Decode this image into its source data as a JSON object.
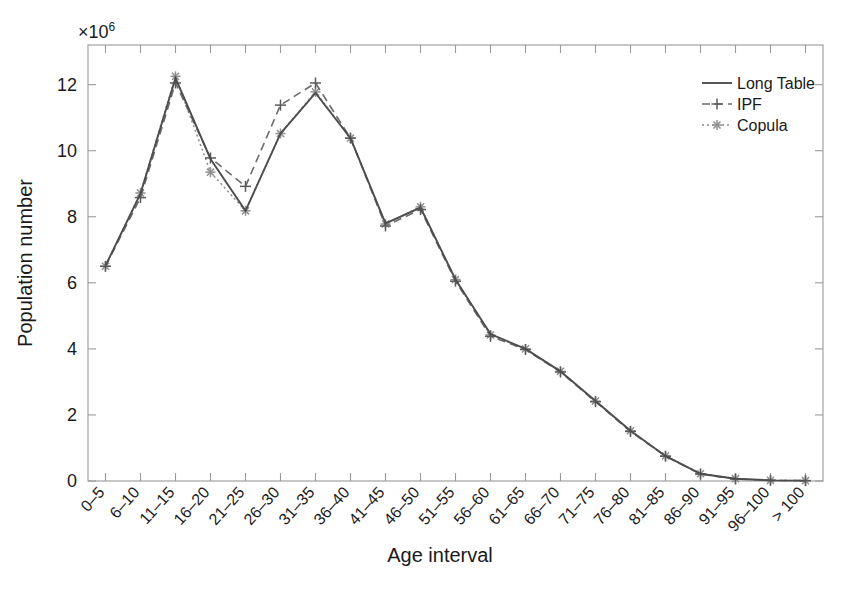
{
  "chart_data": {
    "type": "line",
    "title": "",
    "xlabel": "Age interval",
    "ylabel": "Population number",
    "y_multiplier_text": "×10",
    "y_multiplier_exponent": "6",
    "ylim": [
      0,
      13.2
    ],
    "yticks": [
      0,
      2,
      4,
      6,
      8,
      10,
      12
    ],
    "ytick_labels": [
      "0",
      "2",
      "4",
      "6",
      "8",
      "10",
      "12"
    ],
    "grid": false,
    "legend_position": "top-right",
    "categories": [
      "0–5",
      "6–10",
      "11–15",
      "16–20",
      "21–25",
      "26–30",
      "31–35",
      "36–40",
      "41–45",
      "46–50",
      "51–55",
      "56–60",
      "61–65",
      "66–70",
      "71–75",
      "76–80",
      "81–85",
      "86–90",
      "91–95",
      "96–100",
      "> 100"
    ],
    "series": [
      {
        "name": "Long Table",
        "style": "solid",
        "marker": "none",
        "color": "#4d4d4d",
        "values": [
          6.52,
          8.7,
          12.2,
          9.75,
          8.18,
          10.52,
          11.75,
          10.38,
          7.8,
          8.28,
          6.1,
          4.45,
          4.0,
          3.32,
          2.42,
          1.52,
          0.76,
          0.22,
          0.07,
          0.02,
          0.01
        ]
      },
      {
        "name": "IPF",
        "style": "dashed",
        "marker": "plus",
        "color": "#6b6b6b",
        "values": [
          6.5,
          8.58,
          12.05,
          9.78,
          8.92,
          11.38,
          12.05,
          10.38,
          7.72,
          8.22,
          6.05,
          4.38,
          3.98,
          3.3,
          2.4,
          1.5,
          0.75,
          0.21,
          0.06,
          0.02,
          0.01
        ]
      },
      {
        "name": "Copula",
        "style": "dotted",
        "marker": "star",
        "color": "#8a8a8a",
        "values": [
          6.5,
          8.72,
          12.25,
          9.35,
          8.18,
          10.52,
          11.78,
          10.38,
          7.78,
          8.3,
          6.1,
          4.42,
          4.0,
          3.32,
          2.42,
          1.52,
          0.76,
          0.22,
          0.07,
          0.02,
          0.01
        ]
      }
    ]
  },
  "legend": {
    "entries": [
      {
        "label": "Long Table"
      },
      {
        "label": "IPF"
      },
      {
        "label": "Copula"
      }
    ]
  }
}
